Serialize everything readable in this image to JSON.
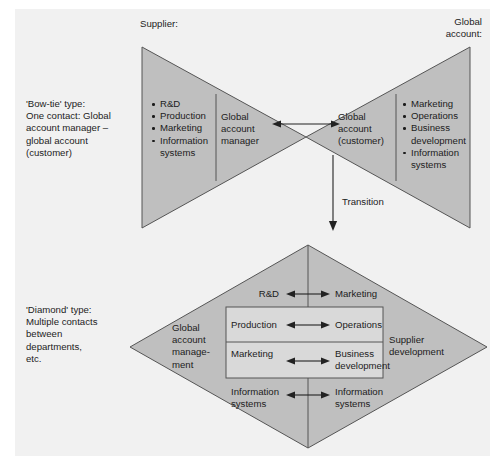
{
  "diagram": {
    "background_color": "#f1f1f1",
    "shape_fill": "#bfbfbf",
    "shape_stroke": "#555555",
    "text_color": "#1c1c1c",
    "inner_box_fill": "#d9d9d9"
  },
  "bowtie": {
    "caption": "'Bow-tie' type:\nOne contact: Global\naccount manager –\nglobal account\n(customer)",
    "caption_lines": [
      "'Bow-tie' type:",
      "One contact: Global",
      "account manager –",
      "global account",
      "(customer)"
    ],
    "supplier_header": "Supplier:",
    "global_account_header_lines": [
      "Global",
      "account:"
    ],
    "supplier_functions": [
      "R&D",
      "Production",
      "Marketing",
      "Information systems"
    ],
    "supplier_contact_lines": [
      "Global",
      "account",
      "manager"
    ],
    "customer_contact_lines": [
      "Global",
      "account",
      "(customer)"
    ],
    "customer_functions": [
      "Marketing",
      "Operations",
      "Business development",
      "Information systems"
    ],
    "link_arrow": "bidirectional"
  },
  "transition": {
    "label": "Transition",
    "direction": "downward"
  },
  "diamond": {
    "caption_lines": [
      "'Diamond' type:",
      "Multiple contacts",
      "between",
      "departments,",
      "etc."
    ],
    "left_label_lines": [
      "Global",
      "account",
      "manage-",
      "ment"
    ],
    "right_label_lines": [
      "Supplier",
      "development"
    ],
    "rows": [
      {
        "left": "R&D",
        "right": "Marketing",
        "boxed": false
      },
      {
        "left": "Production",
        "right": "Operations",
        "boxed": true
      },
      {
        "left": "Marketing",
        "right_lines": [
          "Business",
          "development"
        ],
        "right": "Business development",
        "boxed": true
      },
      {
        "left_lines": [
          "Information",
          "systems"
        ],
        "right_lines": [
          "Information",
          "systems"
        ],
        "left": "Information systems",
        "right": "Information systems",
        "boxed": false
      }
    ],
    "row_arrow": "bidirectional"
  }
}
